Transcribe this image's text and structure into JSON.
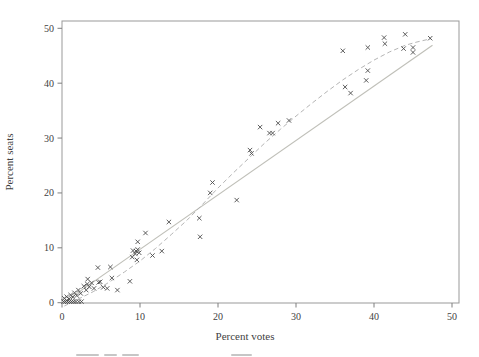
{
  "figure": {
    "background": "#ffffff",
    "frame_color": "#999999",
    "text_color": "#3f3f3f",
    "marker_color": "#4c4c4c",
    "truncated_caption_visible": true
  },
  "chart_data": {
    "type": "scatter",
    "title": "",
    "xlabel": "Percent votes",
    "ylabel": "Percent seats",
    "xlim": [
      0,
      51
    ],
    "ylim": [
      0,
      51.5
    ],
    "xticks": [
      0,
      10,
      20,
      30,
      40,
      50
    ],
    "yticks": [
      0,
      10,
      20,
      30,
      40,
      50
    ],
    "grid": false,
    "legend_position": "none",
    "marker": "x",
    "points": [
      [
        0.2,
        0.2
      ],
      [
        0.45,
        0.2
      ],
      [
        0.7,
        0.2
      ],
      [
        0.95,
        0.2
      ],
      [
        1.2,
        0.2
      ],
      [
        1.5,
        0.2
      ],
      [
        1.8,
        0.2
      ],
      [
        2.15,
        0.2
      ],
      [
        2.5,
        0.2
      ],
      [
        0.3,
        0.8
      ],
      [
        0.6,
        1.1
      ],
      [
        0.9,
        0.7
      ],
      [
        1.1,
        1.4
      ],
      [
        1.4,
        1.0
      ],
      [
        1.6,
        1.8
      ],
      [
        1.9,
        1.3
      ],
      [
        2.1,
        2.3
      ],
      [
        2.4,
        1.7
      ],
      [
        2.8,
        3.0
      ],
      [
        3.1,
        2.3
      ],
      [
        3.25,
        3.4
      ],
      [
        3.3,
        4.3
      ],
      [
        3.5,
        2.9
      ],
      [
        3.8,
        3.6
      ],
      [
        4.1,
        2.6
      ],
      [
        4.7,
        3.7
      ],
      [
        4.6,
        6.4
      ],
      [
        4.9,
        3.8
      ],
      [
        5.3,
        2.8
      ],
      [
        5.8,
        2.6
      ],
      [
        6.2,
        6.5
      ],
      [
        6.4,
        4.5
      ],
      [
        7.1,
        2.3
      ],
      [
        8.7,
        3.9
      ],
      [
        9.0,
        8.3
      ],
      [
        9.1,
        9.5
      ],
      [
        9.4,
        8.9
      ],
      [
        9.5,
        9.4
      ],
      [
        9.7,
        9.7
      ],
      [
        9.9,
        9.1
      ],
      [
        9.6,
        7.8
      ],
      [
        9.7,
        11.1
      ],
      [
        10.7,
        12.7
      ],
      [
        11.6,
        8.6
      ],
      [
        12.8,
        9.4
      ],
      [
        13.7,
        14.7
      ],
      [
        17.6,
        15.4
      ],
      [
        17.7,
        12.0
      ],
      [
        19.0,
        20.0
      ],
      [
        19.3,
        21.9
      ],
      [
        22.4,
        18.7
      ],
      [
        24.1,
        27.8
      ],
      [
        24.3,
        27.2
      ],
      [
        25.4,
        32.0
      ],
      [
        26.6,
        30.9
      ],
      [
        27.0,
        30.9
      ],
      [
        27.7,
        32.7
      ],
      [
        29.1,
        33.2
      ],
      [
        36.0,
        45.9
      ],
      [
        36.3,
        39.3
      ],
      [
        37.0,
        38.2
      ],
      [
        39.0,
        40.5
      ],
      [
        39.2,
        42.3
      ],
      [
        39.2,
        46.5
      ],
      [
        41.3,
        48.3
      ],
      [
        41.4,
        47.2
      ],
      [
        43.8,
        46.3
      ],
      [
        44.0,
        48.9
      ],
      [
        45.0,
        46.5
      ],
      [
        45.0,
        45.6
      ],
      [
        47.2,
        48.2
      ]
    ],
    "fit_lines": [
      {
        "name": "straight-fit-line",
        "style": "solid",
        "color": "#bfbfb8",
        "endpoints": [
          [
            0.3,
            0.1
          ],
          [
            47.5,
            46.9
          ]
        ]
      },
      {
        "name": "curved-fit-line",
        "style": "dashed",
        "color": "#b5b5b5",
        "points": [
          [
            0.3,
            -0.6
          ],
          [
            2,
            0.6
          ],
          [
            4,
            2.0
          ],
          [
            6,
            3.7
          ],
          [
            8,
            5.6
          ],
          [
            10,
            7.6
          ],
          [
            12,
            9.9
          ],
          [
            14,
            12.4
          ],
          [
            16,
            15.0
          ],
          [
            18,
            17.9
          ],
          [
            20,
            20.9
          ],
          [
            22,
            23.7
          ],
          [
            24,
            26.4
          ],
          [
            26,
            29.1
          ],
          [
            28,
            31.6
          ],
          [
            30,
            34.0
          ],
          [
            32,
            36.3
          ],
          [
            34,
            38.5
          ],
          [
            36,
            40.6
          ],
          [
            38,
            42.5
          ],
          [
            40,
            44.2
          ],
          [
            42,
            45.7
          ],
          [
            44,
            46.9
          ],
          [
            45.5,
            47.5
          ],
          [
            47.3,
            48.1
          ]
        ]
      }
    ]
  }
}
